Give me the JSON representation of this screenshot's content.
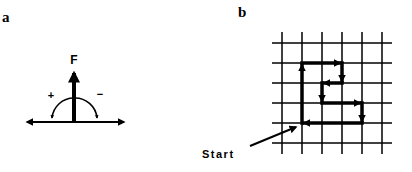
{
  "panels": [
    {
      "label": "a",
      "force_label": "F",
      "plus_label": "+",
      "minus_label": "−",
      "description": "Force vector F perpendicular to horizontal axis with curved arrows showing + and − rotation directions"
    },
    {
      "label": "b",
      "start_label": "Start",
      "grid": {
        "columns": 6,
        "rows": 6,
        "spacing_px": 20
      },
      "path": {
        "description": "Closed path traced on grid starting at lower-left corner",
        "moves": [
          "up 3",
          "right 2",
          "down 1",
          "left 1",
          "down 1",
          "right 2",
          "down 1",
          "left 3"
        ]
      }
    }
  ],
  "colors": {
    "ink": "#000000",
    "background": "#ffffff"
  }
}
